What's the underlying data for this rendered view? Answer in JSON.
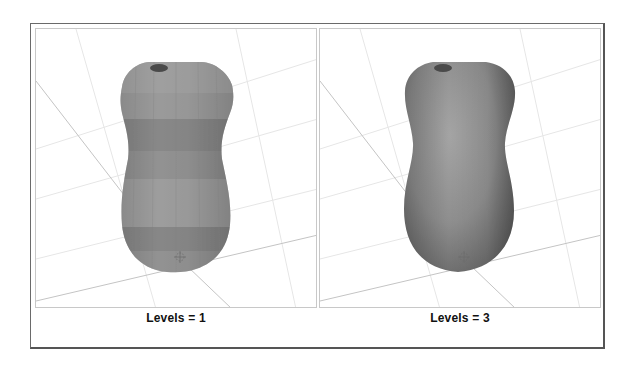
{
  "figure": {
    "panels": [
      {
        "id": "left",
        "caption": "Levels = 1",
        "shading": "faceted",
        "object": "vase-mesh",
        "band_colors": [
          "#9a9a9a",
          "#828282",
          "#8e8e8e",
          "#7c7c7c",
          "#969696",
          "#8a8a8a",
          "#7e7e7e"
        ]
      },
      {
        "id": "right",
        "caption": "Levels = 3",
        "shading": "smooth",
        "object": "vase-mesh"
      }
    ],
    "colors": {
      "frame_border": "#6a6a6a",
      "viewport_border": "#c8c8c8",
      "grid_line": "#d4d4d4",
      "axis_line": "#bdbdbd",
      "mesh_base": "#8c8c8c",
      "mesh_highlight": "#a8a8a8",
      "mesh_shadow": "#6e6e6e"
    }
  }
}
